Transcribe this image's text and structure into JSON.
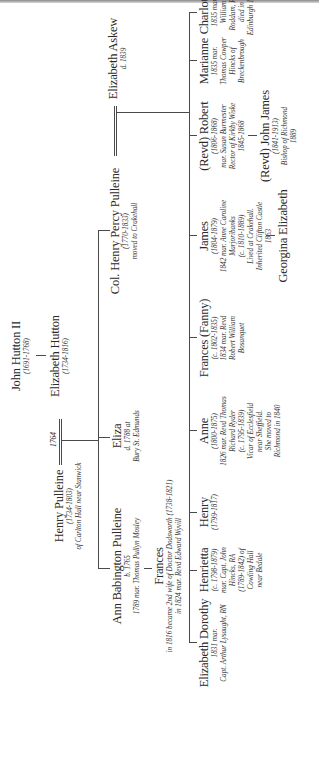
{
  "tree": {
    "orientation": "rotated -90deg (reads bottom-to-top)",
    "john_hutton": {
      "name": "John Hutton II",
      "dates": "(1691-1768)"
    },
    "elizabeth_hutton": {
      "name": "Elizabeth Hutton",
      "dates": "(1734-1816)"
    },
    "henry_pulleine": {
      "name": "Henry Pulleine",
      "dates": "(1734-1803)",
      "note": "of Carlton Hall near Stanwick"
    },
    "marriage_year": "1764",
    "eliza": {
      "name": "Eliza",
      "note1": "d. 1788 at",
      "note2": "Bury St. Edmunds"
    },
    "ann_babington": {
      "name": "Ann Babington Pulleine",
      "dates": "b. 1765",
      "note": "1789 mar. Thomas Pullyn Mosley"
    },
    "frances_elder": {
      "name": "Frances",
      "note1": "in 1816 became 2nd wife of Doctor Dodsworth (1738-1821)",
      "note2": "in 1824 mar. Revd Edward Wyvill"
    },
    "col_henry_percy": {
      "name": "Col. Henry Percy Pulleine",
      "dates": "(1770-1833)",
      "note": "moved to Crakehall"
    },
    "elizabeth_askew": {
      "name": "Elizabeth Askew",
      "dates": "d. 1839"
    },
    "children": [
      {
        "name": "Elizabeth Dorothy",
        "lines": [
          "1831 mar.",
          "Capt. Arthur Lysaught, RN"
        ]
      },
      {
        "name": "Henrietta",
        "lines": [
          "(c. 1798-1879)",
          "mar. Capt. John",
          "Hincks, RA",
          "(1789-1842) of",
          "Cowling Hall",
          "near Bedale"
        ]
      },
      {
        "name": "Henry",
        "lines": [
          "(1799-1817)"
        ]
      },
      {
        "name": "Anne",
        "lines": [
          "(1800-1875)",
          "1826 mar. Revd Thomas",
          "Richard Ryder",
          "(c. 1795-1839)",
          "Vicar of Ecclesfield",
          "near Sheffield.",
          "She moved to",
          "Richmond in 1840"
        ]
      },
      {
        "name": "Frances (Fanny)",
        "lines": [
          "(c. 1802-1835)",
          "1834 mar. Revd",
          "Robert William",
          "Bosanquet"
        ]
      },
      {
        "name": "James",
        "lines": [
          "(1804-1879)",
          "1842 mar. Anne Caroline",
          "Marjoribanks",
          "(c. 1810-1889)",
          "Lived at Crakehall.",
          "Inherited Clifton Castle",
          "1863"
        ]
      },
      {
        "name": "(Revd) Robert",
        "lines": [
          "(1806-1868)",
          "mar. Susan Burmester",
          "Rector of Kirkby Wiske",
          "1845-1868"
        ]
      },
      {
        "name": "Marianne",
        "lines": [
          "1835 mar.",
          "Thomas Cowper",
          "Hincks of",
          "Breckenbrough"
        ]
      },
      {
        "name": "Charlotte",
        "lines": [
          "1835 mar.",
          "William",
          "Roddam, RN",
          "died in",
          "Edinburgh 1837"
        ]
      }
    ],
    "grandchildren": {
      "georgina": {
        "name": "Georgina Elizabeth"
      },
      "john_james": {
        "name": "(Revd) John James",
        "dates": "(1841-1913)",
        "note1": "Bishop of Richmond",
        "note2": "1889"
      }
    }
  }
}
